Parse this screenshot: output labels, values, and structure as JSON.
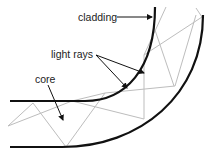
{
  "diagram": {
    "title": "",
    "labels": {
      "cladding": "cladding",
      "light_rays": "light rays",
      "core": "core"
    },
    "colors": {
      "fiber_wall": "#111111",
      "ray": "#bdbdbd",
      "arrow": "#111111",
      "background": "#ffffff"
    }
  }
}
